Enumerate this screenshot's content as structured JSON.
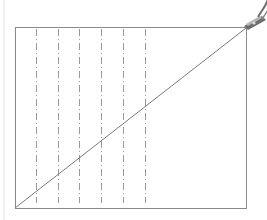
{
  "diagram": {
    "kind": "folded-paper-guide",
    "colors": {
      "frame": "#8a8a8a",
      "dashed": "#9a9a9a",
      "diagonal": "#7a7a7a",
      "edge_line": "#e2e2e2",
      "clip_body": "#6e6e6e",
      "clip_light": "#b5b5b5"
    },
    "frame": {
      "x": 15,
      "y": 27,
      "width": 231,
      "height": 181
    },
    "dashed_lines_x": [
      36,
      58,
      79,
      101,
      123,
      145
    ],
    "dashed_y_range": [
      29,
      203
    ],
    "diagonal": {
      "from": [
        15,
        208
      ],
      "to": [
        246,
        28
      ]
    },
    "clip": {
      "icon": "clothespin-icon",
      "anchor": [
        246,
        27
      ]
    }
  }
}
